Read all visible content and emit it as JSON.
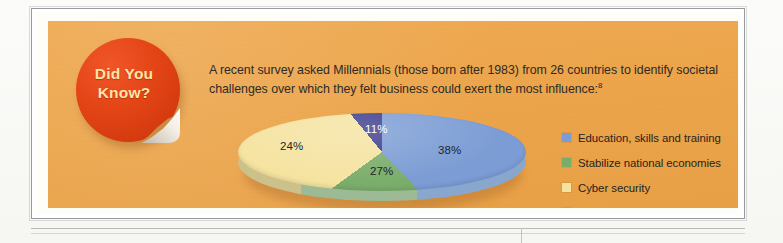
{
  "callout": {
    "badge": {
      "line1": "Did You",
      "line2": "Know?"
    },
    "intro_text": "A recent survey asked Millennials (those born after 1983) from 26 countries to identify societal challenges over which they felt business could exert the most influence:",
    "footnote_marker": "8"
  },
  "colors": {
    "panel_background": "#eda54b",
    "badge_red": "#e44517",
    "badge_text": "#ffe4a8",
    "education_blue": "#7b9cd4",
    "stabilize_green": "#7aad6b",
    "cyber_yellow": "#f5e3a0",
    "other_navy": "#3a3a8c"
  },
  "chart_data": {
    "type": "pie",
    "title": "",
    "categories": [
      "Education, skills and training",
      "Stabilize national economies",
      "Cyber security",
      "Other"
    ],
    "values": [
      38,
      27,
      24,
      11
    ],
    "value_labels": [
      "38%",
      "27%",
      "24%",
      "11%"
    ],
    "unit": "%",
    "colors": [
      "#7b9cd4",
      "#7aad6b",
      "#f5e3a0",
      "#3a3a8c"
    ],
    "legend_position": "right",
    "three_d": true,
    "grid": false
  },
  "legend": {
    "items": [
      {
        "label": "Education, skills and training",
        "color": "#7b9cd4"
      },
      {
        "label": "Stabilize national economies",
        "color": "#7aad6b"
      },
      {
        "label": "Cyber security",
        "color": "#f5e3a0"
      },
      {
        "label": "Other",
        "color": "#3a3a8c"
      }
    ]
  }
}
